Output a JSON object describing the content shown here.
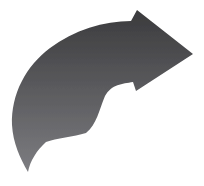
{
  "page": {
    "background_color": "#ffffff"
  },
  "icon": {
    "name": "curved-arrow-right",
    "description": "Gray gradient curved swoosh arrow pointing to the upper right",
    "gradient_top_color": "#3a3a3c",
    "gradient_middle_color": "#59595c",
    "gradient_bottom_color": "#7e7e82"
  }
}
